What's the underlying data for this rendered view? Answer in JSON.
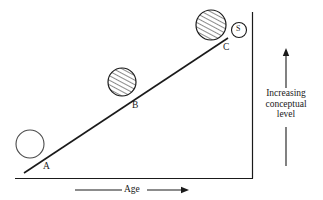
{
  "figure": {
    "axes": {
      "x_axis_label": "Age",
      "y_axis_label_line1": "Increasing",
      "y_axis_label_line2": "conceptual",
      "y_axis_label_line3": "level",
      "x_axis_arrow": "arrow-right",
      "y_axis_arrow": "arrow-up"
    },
    "points": [
      {
        "label": "A",
        "fill": "empty",
        "note": "open circle at lower left of trend line"
      },
      {
        "label": "B",
        "fill": "hatched",
        "note": "hatched circle at middle of trend line"
      },
      {
        "label": "C",
        "fill": "hatched",
        "note": "hatched circle at upper right of trend line"
      }
    ],
    "marker_s": {
      "label": "S",
      "shape": "circle-outline"
    },
    "trend_line": {
      "description": "straight ascending line from lower left to upper right"
    },
    "colors": {
      "ink": "#1a1a1a",
      "background": "#ffffff",
      "hatch": "#2b2b2b"
    }
  }
}
